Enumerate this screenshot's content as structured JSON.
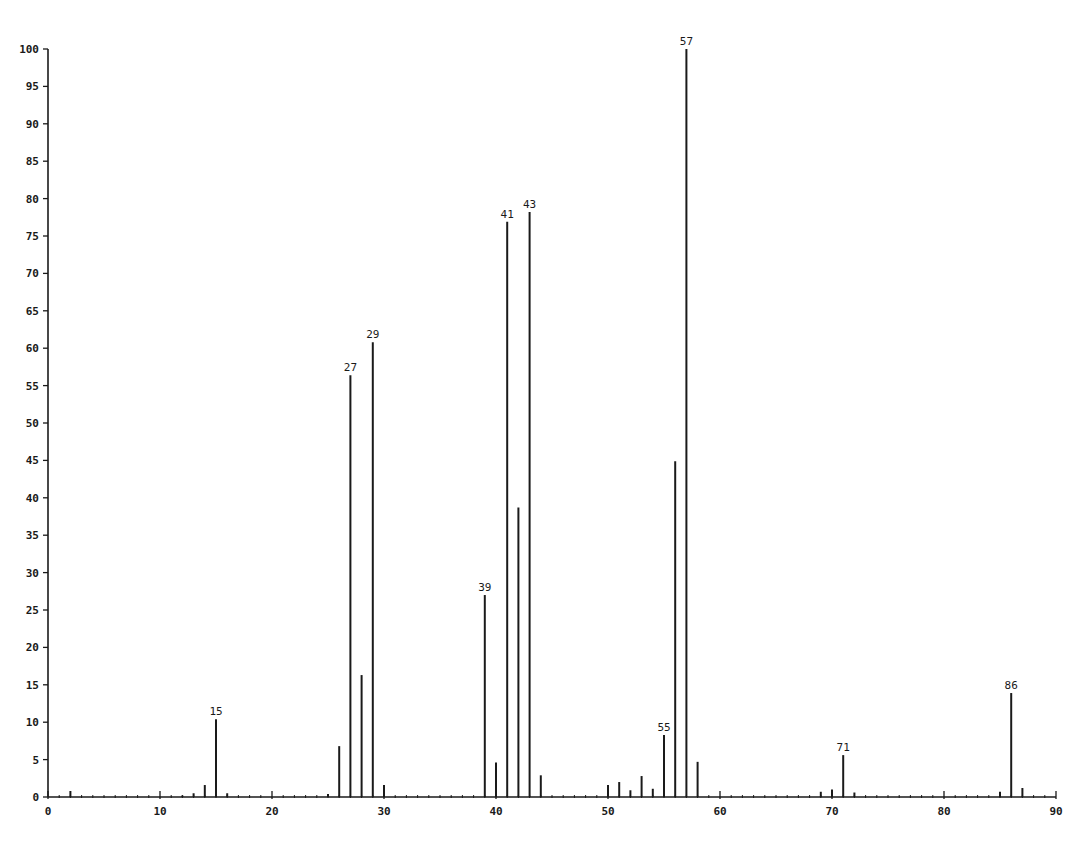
{
  "chart_data": {
    "type": "bar",
    "title": "",
    "xlabel": "",
    "ylabel": "",
    "xlim": [
      0,
      90
    ],
    "ylim": [
      0,
      100
    ],
    "grid": false,
    "legend": null,
    "x_ticks": [
      0,
      10,
      20,
      30,
      40,
      50,
      60,
      70,
      80,
      90
    ],
    "x_tick_labels": [
      "0",
      "10",
      "20",
      "30",
      "40",
      "50",
      "60",
      "70",
      "80",
      "90"
    ],
    "y_ticks": [
      0,
      5,
      10,
      15,
      20,
      25,
      30,
      35,
      40,
      45,
      50,
      55,
      60,
      65,
      70,
      75,
      80,
      85,
      90,
      95,
      100
    ],
    "y_tick_labels": [
      "0",
      "5",
      "10",
      "15",
      "20",
      "25",
      "30",
      "35",
      "40",
      "45",
      "50",
      "55",
      "60",
      "65",
      "70",
      "75",
      "80",
      "85",
      "90",
      "95",
      "100"
    ],
    "series": [
      {
        "name": "relative abundance",
        "x": [
          2,
          12,
          13,
          14,
          15,
          16,
          25,
          26,
          27,
          28,
          29,
          30,
          39,
          40,
          41,
          42,
          43,
          44,
          50,
          51,
          52,
          53,
          54,
          55,
          56,
          57,
          58,
          69,
          70,
          71,
          72,
          85,
          86,
          87
        ],
        "values": [
          0.8,
          0.2,
          0.5,
          1.6,
          10.4,
          0.5,
          0.4,
          6.8,
          56.4,
          16.3,
          60.8,
          1.6,
          27.0,
          4.6,
          76.9,
          38.7,
          78.2,
          2.9,
          1.6,
          2.0,
          0.9,
          2.8,
          1.1,
          8.3,
          44.9,
          100,
          4.7,
          0.7,
          1.0,
          5.6,
          0.6,
          0.7,
          13.9,
          1.2
        ]
      }
    ],
    "annotations": [
      {
        "x": 15,
        "label": "15"
      },
      {
        "x": 27,
        "label": "27"
      },
      {
        "x": 29,
        "label": "29"
      },
      {
        "x": 39,
        "label": "39"
      },
      {
        "x": 41,
        "label": "41"
      },
      {
        "x": 43,
        "label": "43"
      },
      {
        "x": 55,
        "label": "55"
      },
      {
        "x": 57,
        "label": "57"
      },
      {
        "x": 71,
        "label": "71"
      },
      {
        "x": 86,
        "label": "86"
      }
    ]
  }
}
